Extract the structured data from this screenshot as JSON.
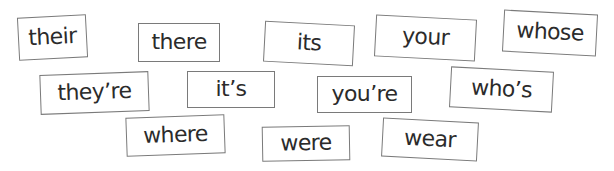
{
  "cards": [
    {
      "word": "their",
      "left": 18,
      "top": 16,
      "width": 69,
      "height": 43,
      "rotate": -3
    },
    {
      "word": "there",
      "left": 138,
      "top": 23,
      "width": 82,
      "height": 39,
      "rotate": 0
    },
    {
      "word": "its",
      "left": 264,
      "top": 23,
      "width": 90,
      "height": 41,
      "rotate": 3
    },
    {
      "word": "your",
      "left": 375,
      "top": 17,
      "width": 101,
      "height": 42,
      "rotate": 3
    },
    {
      "word": "whose",
      "left": 503,
      "top": 12,
      "width": 94,
      "height": 42,
      "rotate": 3
    },
    {
      "word": "they’re",
      "left": 40,
      "top": 73,
      "width": 109,
      "height": 40,
      "rotate": -2
    },
    {
      "word": "it’s",
      "left": 187,
      "top": 71,
      "width": 88,
      "height": 37,
      "rotate": 0
    },
    {
      "word": "you’re",
      "left": 317,
      "top": 76,
      "width": 95,
      "height": 37,
      "rotate": 0
    },
    {
      "word": "who’s",
      "left": 450,
      "top": 69,
      "width": 103,
      "height": 41,
      "rotate": 3
    },
    {
      "word": "where",
      "left": 126,
      "top": 116,
      "width": 99,
      "height": 39,
      "rotate": -2
    },
    {
      "word": "were",
      "left": 262,
      "top": 126,
      "width": 88,
      "height": 35,
      "rotate": -1
    },
    {
      "word": "wear",
      "left": 382,
      "top": 120,
      "width": 96,
      "height": 39,
      "rotate": 3
    }
  ],
  "colors": {
    "card_border": "#7a7a7a",
    "text": "#2b2b2b",
    "background": "#ffffff"
  }
}
